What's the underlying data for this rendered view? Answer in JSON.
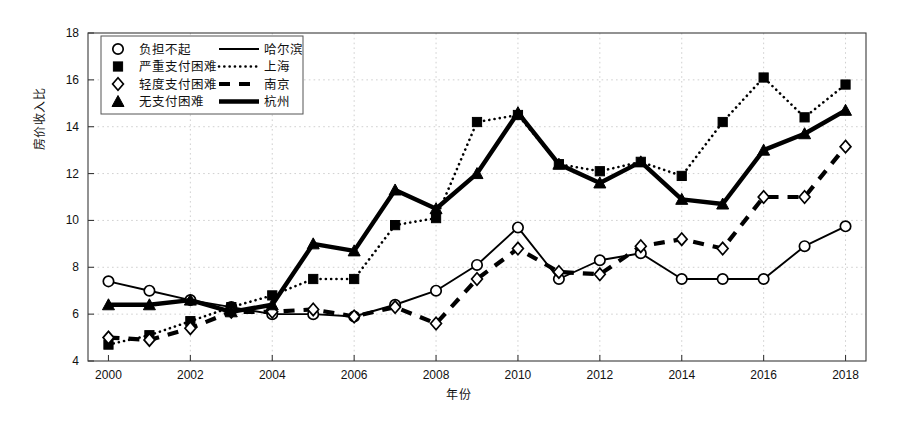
{
  "chart_data": {
    "type": "line",
    "title": "",
    "xlabel": "年份",
    "ylabel": "房价收入比",
    "xlim": [
      1999.5,
      2018.5
    ],
    "ylim": [
      4,
      18
    ],
    "ytick_step": 2,
    "xtick_step": 2,
    "grid": true,
    "legend_position": "top-left",
    "x": [
      2000,
      2001,
      2002,
      2003,
      2004,
      2005,
      2006,
      2007,
      2008,
      2009,
      2010,
      2011,
      2012,
      2013,
      2014,
      2015,
      2016,
      2017,
      2018
    ],
    "xticks": [
      "2000",
      "2002",
      "2004",
      "2006",
      "2008",
      "2010",
      "2012",
      "2014",
      "2016",
      "2018"
    ],
    "yticks": [
      "4",
      "6",
      "8",
      "10",
      "12",
      "14",
      "16",
      "18"
    ],
    "series": [
      {
        "name": "哈尔滨",
        "marker": "circle-open",
        "linestyle": "solid",
        "affordability_label": "负担不起",
        "values": [
          7.4,
          7.0,
          6.6,
          6.3,
          6.0,
          6.0,
          5.9,
          6.4,
          7.0,
          8.1,
          9.7,
          7.5,
          8.3,
          8.6,
          7.5,
          7.5,
          7.5,
          8.9,
          9.75
        ]
      },
      {
        "name": "上海",
        "marker": "square-filled",
        "linestyle": "dotted",
        "affordability_label": "严重支付困难",
        "values": [
          4.7,
          5.1,
          5.7,
          6.3,
          6.8,
          7.5,
          7.5,
          9.8,
          10.1,
          14.2,
          14.5,
          12.4,
          12.1,
          12.5,
          11.9,
          14.2,
          16.1,
          14.4,
          15.8
        ]
      },
      {
        "name": "南京",
        "marker": "diamond-open",
        "linestyle": "dashed",
        "affordability_label": "轻度支付困难",
        "values": [
          5.0,
          4.9,
          5.4,
          6.1,
          6.1,
          6.2,
          5.9,
          6.3,
          5.6,
          7.5,
          8.8,
          7.8,
          7.7,
          8.9,
          9.2,
          8.8,
          11.0,
          11.0,
          13.15
        ]
      },
      {
        "name": "杭州",
        "marker": "triangle-filled",
        "linestyle": "solid-thick",
        "affordability_label": "无支付困难",
        "values": [
          6.4,
          6.4,
          6.6,
          6.1,
          6.4,
          9.0,
          8.7,
          11.3,
          10.5,
          12.0,
          14.6,
          12.4,
          11.6,
          12.5,
          10.9,
          10.7,
          13.0,
          13.7,
          14.7
        ]
      }
    ]
  },
  "legend": {
    "rows": [
      {
        "marker_name": "circle-open-marker",
        "affordability": "负担不起",
        "city": "哈尔滨",
        "line_name": "solid-line-sample"
      },
      {
        "marker_name": "square-filled-marker",
        "affordability": "严重支付困难",
        "city": "上海",
        "line_name": "dotted-line-sample"
      },
      {
        "marker_name": "diamond-open-marker",
        "affordability": "轻度支付困难",
        "city": "南京",
        "line_name": "dashed-line-sample"
      },
      {
        "marker_name": "triangle-filled-marker",
        "affordability": "无支付困难",
        "city": "杭州",
        "line_name": "thick-line-sample"
      }
    ]
  },
  "colors": {
    "ink": "#000000",
    "frame": "#3a3a3a",
    "grid": "#bbbbbb",
    "background": "#ffffff"
  }
}
